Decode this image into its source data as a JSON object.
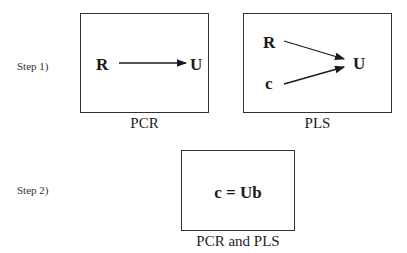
{
  "steps": [
    {
      "label": "Step 1)"
    },
    {
      "label": "Step 2)"
    }
  ],
  "panels": {
    "pcr": {
      "caption": "PCR",
      "from": "R",
      "to": "U"
    },
    "pls": {
      "caption": "PLS",
      "from_top": "R",
      "from_bottom": "c",
      "to": "U"
    },
    "both": {
      "caption": "PCR and PLS",
      "equation": "c = Ub"
    }
  }
}
